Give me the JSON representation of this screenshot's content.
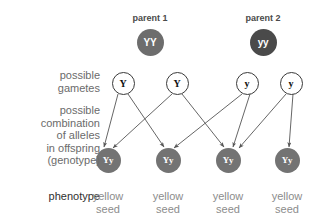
{
  "diagram": {
    "colors": {
      "parent_dominant_fill": "#6d6d6d",
      "parent_recessive_fill": "#4a4a4a",
      "offspring_fill": "#737373",
      "gamete_fill": "#ffffff",
      "gamete_stroke": "#3a3a3a",
      "connector_stroke": "#555555",
      "label_gray": "#6b6b6b",
      "label_dark": "#2f2f2f",
      "phenotype_gray": "#8c8c8c"
    }
  },
  "parents": [
    {
      "caption": "parent 1",
      "genotype": "YY",
      "type": "dominant",
      "cx": 150,
      "cy": 42
    },
    {
      "caption": "parent 2",
      "genotype": "yy",
      "type": "recessive",
      "cx": 263,
      "cy": 42
    }
  ],
  "row_labels": {
    "gametes": "possible\ngametes",
    "gametes_line1": "possible",
    "gametes_line2": "gametes",
    "genotype_line1": "possible",
    "genotype_line2": "combination",
    "genotype_line3": "of alleles",
    "genotype_line4": "in offspring",
    "genotype_line5": "(genotype)",
    "phenotype": "phenotype"
  },
  "gametes": [
    {
      "allele": "Y",
      "from_parent": "parent 1",
      "cx": 123,
      "cy": 83
    },
    {
      "allele": "Y",
      "from_parent": "parent 1",
      "cx": 177,
      "cy": 83
    },
    {
      "allele": "y",
      "from_parent": "parent 2",
      "cx": 247,
      "cy": 83
    },
    {
      "allele": "y",
      "from_parent": "parent 2",
      "cx": 291,
      "cy": 83
    }
  ],
  "offspring": [
    {
      "genotype": "Yy",
      "cx": 108,
      "cy": 160
    },
    {
      "genotype": "Yy",
      "cx": 168,
      "cy": 160
    },
    {
      "genotype": "Yy",
      "cx": 228,
      "cy": 160
    },
    {
      "genotype": "Yy",
      "cx": 287,
      "cy": 160
    }
  ],
  "phenotypes": [
    {
      "line1": "yellow",
      "line2": "seed",
      "cx": 108
    },
    {
      "line1": "yellow",
      "line2": "seed",
      "cx": 168
    },
    {
      "line1": "yellow",
      "line2": "seed",
      "cx": 228
    },
    {
      "line1": "yellow",
      "line2": "seed",
      "cx": 287
    }
  ],
  "connectors": [
    {
      "from": "gamete-0",
      "to": "offspring-0",
      "x1": 118,
      "y1": 94,
      "x2": 104,
      "y2": 147
    },
    {
      "from": "gamete-0",
      "to": "offspring-1",
      "x1": 128,
      "y1": 94,
      "x2": 164,
      "y2": 147
    },
    {
      "from": "gamete-1",
      "to": "offspring-0",
      "x1": 172,
      "y1": 94,
      "x2": 113,
      "y2": 148
    },
    {
      "from": "gamete-1",
      "to": "offspring-2",
      "x1": 182,
      "y1": 94,
      "x2": 224,
      "y2": 147
    },
    {
      "from": "gamete-2",
      "to": "offspring-1",
      "x1": 242,
      "y1": 94,
      "x2": 174,
      "y2": 148
    },
    {
      "from": "gamete-2",
      "to": "offspring-2",
      "x1": 250,
      "y1": 94,
      "x2": 233,
      "y2": 147
    },
    {
      "from": "gamete-3",
      "to": "offspring-2",
      "x1": 286,
      "y1": 94,
      "x2": 239,
      "y2": 148
    },
    {
      "from": "gamete-3",
      "to": "offspring-3",
      "x1": 293,
      "y1": 94,
      "x2": 289,
      "y2": 147
    }
  ]
}
